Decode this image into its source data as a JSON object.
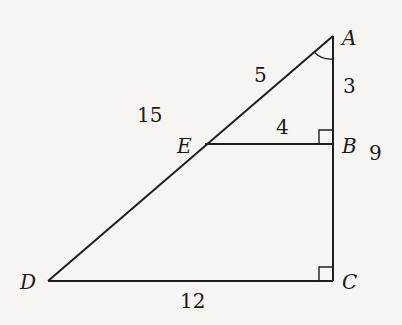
{
  "diagram": {
    "type": "similar-right-triangles",
    "vertices": {
      "A": {
        "label": "A",
        "x": 333,
        "y": 36
      },
      "B": {
        "label": "B",
        "x": 333,
        "y": 144
      },
      "C": {
        "label": "C",
        "x": 333,
        "y": 281
      },
      "D": {
        "label": "D",
        "x": 48,
        "y": 281
      },
      "E": {
        "label": "E",
        "x": 205,
        "y": 144
      }
    },
    "segments": [
      {
        "from": "A",
        "to": "D"
      },
      {
        "from": "A",
        "to": "C"
      },
      {
        "from": "D",
        "to": "C"
      },
      {
        "from": "E",
        "to": "B"
      }
    ],
    "lengths": {
      "AE": "5",
      "ED": "15",
      "AB": "3",
      "BC": "9",
      "EB": "4",
      "DC": "12"
    },
    "right_angles": [
      "B",
      "C"
    ],
    "angle_marks": [
      "A"
    ],
    "colors": {
      "line": "#1f1f1f",
      "background": "#f6f5f2"
    }
  }
}
